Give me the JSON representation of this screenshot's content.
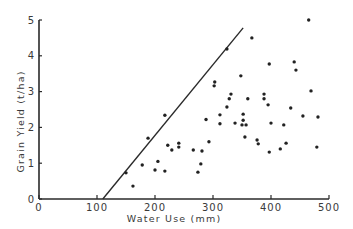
{
  "chart_data": {
    "type": "scatter",
    "title": "",
    "xlabel": "Water Use (mm)",
    "ylabel": "Grain Yield (t/ha)",
    "xlim": [
      0,
      500
    ],
    "ylim": [
      0,
      5
    ],
    "x_ticks": [
      0,
      100,
      200,
      300,
      400,
      500
    ],
    "y_ticks": [
      0,
      1,
      2,
      3,
      4,
      5
    ],
    "grid": false,
    "legend": "none",
    "series": [
      {
        "name": "observations",
        "points": [
          [
            150,
            0.73
          ],
          [
            162,
            0.36
          ],
          [
            178,
            0.95
          ],
          [
            188,
            1.7
          ],
          [
            200,
            0.81
          ],
          [
            205,
            1.05
          ],
          [
            217,
            0.78
          ],
          [
            217,
            2.34
          ],
          [
            222,
            1.5
          ],
          [
            229,
            1.37
          ],
          [
            241,
            1.56
          ],
          [
            241,
            1.45
          ],
          [
            266,
            1.37
          ],
          [
            274,
            0.75
          ],
          [
            279,
            0.98
          ],
          [
            281,
            1.34
          ],
          [
            288,
            2.22
          ],
          [
            293,
            1.6
          ],
          [
            302,
            3.16
          ],
          [
            303,
            3.27
          ],
          [
            312,
            2.35
          ],
          [
            312,
            2.1
          ],
          [
            324,
            4.19
          ],
          [
            324,
            2.57
          ],
          [
            328,
            2.8
          ],
          [
            331,
            2.93
          ],
          [
            338,
            2.12
          ],
          [
            348,
            3.44
          ],
          [
            350,
            2.07
          ],
          [
            352,
            2.2
          ],
          [
            352,
            2.37
          ],
          [
            355,
            1.73
          ],
          [
            357,
            2.07
          ],
          [
            360,
            2.8
          ],
          [
            367,
            4.5
          ],
          [
            376,
            1.65
          ],
          [
            378,
            1.54
          ],
          [
            388,
            2.93
          ],
          [
            388,
            2.8
          ],
          [
            395,
            2.63
          ],
          [
            397,
            3.77
          ],
          [
            397,
            1.31
          ],
          [
            400,
            2.12
          ],
          [
            416,
            1.4
          ],
          [
            422,
            2.07
          ],
          [
            426,
            1.56
          ],
          [
            434,
            2.54
          ],
          [
            440,
            3.83
          ],
          [
            443,
            3.6
          ],
          [
            455,
            2.32
          ],
          [
            465,
            5.0
          ],
          [
            469,
            3.02
          ],
          [
            479,
            1.45
          ],
          [
            481,
            2.29
          ]
        ]
      }
    ],
    "boundary_line": {
      "name": "upper boundary",
      "x": [
        110,
        352
      ],
      "y": [
        0,
        4.78
      ]
    }
  }
}
